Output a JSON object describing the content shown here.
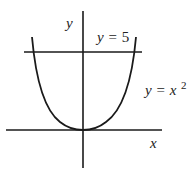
{
  "diagram": {
    "axes": {
      "x_label": "x",
      "y_label": "y"
    },
    "curves": [
      {
        "name": "parabola",
        "equation": "y = x^2",
        "label_var": "y",
        "label_eq": "=",
        "label_x": "x",
        "label_exp": "2"
      },
      {
        "name": "horizontal-line",
        "equation": "y = 5",
        "label_var": "y",
        "label_eq": "=",
        "label_val": "5"
      }
    ],
    "colors": {
      "stroke": "#1a1a1a",
      "text": "#222222",
      "background": "#ffffff"
    }
  }
}
